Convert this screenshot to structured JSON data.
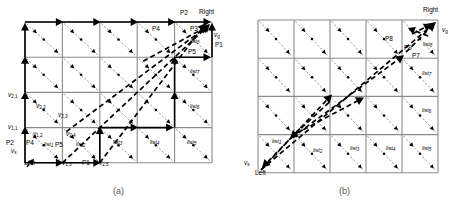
{
  "figure": {
    "type": "technical-diagram",
    "panels": [
      {
        "id": "a",
        "caption": "(a)",
        "grid": {
          "cols": 5,
          "rows": 4,
          "x": 25,
          "y": 22,
          "cell_w": 37.4,
          "cell_h": 35.2
        },
        "terminals": [
          {
            "name": "source-label",
            "text": "v",
            "sub": "s",
            "x": 11,
            "y": 148
          },
          {
            "name": "left-label",
            "text": "Left",
            "sub": "",
            "x": 24,
            "y": 160
          },
          {
            "name": "goal-label",
            "text": "v",
            "sub": "g",
            "x": 214,
            "y": 32
          },
          {
            "name": "right-label",
            "text": "Right",
            "sub": "",
            "x": 199,
            "y": 9
          }
        ],
        "vertex_labels": [
          {
            "name": "vertex-2-1",
            "text": "v",
            "sub": "2,1",
            "x": 8,
            "y": 92
          },
          {
            "name": "vertex-2-2",
            "text": "v",
            "sub": "2,2",
            "x": 36,
            "y": 103
          },
          {
            "name": "vertex-2-3",
            "text": "v",
            "sub": "2,3",
            "x": 58,
            "y": 112
          },
          {
            "name": "vertex-1-1",
            "text": "v",
            "sub": "1,1",
            "x": 8,
            "y": 124
          },
          {
            "name": "vertex-1-2",
            "text": "v",
            "sub": "1,2",
            "x": 33,
            "y": 131
          },
          {
            "name": "vertex-2-4",
            "text": "v",
            "sub": "2,4",
            "x": 66,
            "y": 131
          },
          {
            "name": "vertex-1-3",
            "text": "v",
            "sub": "1,3",
            "x": 62,
            "y": 160
          },
          {
            "name": "vertex-2-5",
            "text": "v",
            "sub": "2,5",
            "x": 99,
            "y": 160
          }
        ],
        "path_labels": [
          {
            "name": "path-p2-bottom",
            "text": "P2",
            "x": 6,
            "y": 140
          },
          {
            "name": "path-p4-bottom",
            "text": "P4",
            "x": 26,
            "y": 140
          },
          {
            "name": "path-p5-bottom",
            "text": "P5",
            "x": 55,
            "y": 142
          },
          {
            "name": "path-p1-bottom",
            "text": "P1",
            "x": 82,
            "y": 160
          },
          {
            "name": "path-p2-top",
            "text": "P2",
            "x": 180,
            "y": 10
          },
          {
            "name": "path-p4-top",
            "text": "P4",
            "x": 152,
            "y": 26
          },
          {
            "name": "path-p3-top",
            "text": "P3",
            "x": 190,
            "y": 26
          },
          {
            "name": "path-p1-right",
            "text": "P1",
            "x": 215,
            "y": 42
          },
          {
            "name": "path-p5-right",
            "text": "P5",
            "x": 188,
            "y": 49
          }
        ],
        "list_labels": [
          {
            "name": "list-1",
            "text": "list",
            "sub": "1",
            "x": 44,
            "y": 142
          },
          {
            "name": "list-2",
            "text": "list",
            "sub": "2",
            "x": 76,
            "y": 142
          },
          {
            "name": "list-3",
            "text": "list",
            "sub": "3",
            "x": 113,
            "y": 140
          },
          {
            "name": "list-4",
            "text": "list",
            "sub": "4",
            "x": 150,
            "y": 140
          },
          {
            "name": "list-5",
            "text": "list",
            "sub": "5",
            "x": 187,
            "y": 140
          },
          {
            "name": "list-6",
            "text": "list",
            "sub": "6",
            "x": 190,
            "y": 104
          },
          {
            "name": "list-7",
            "text": "list",
            "sub": "7",
            "x": 190,
            "y": 69
          },
          {
            "name": "list-8",
            "text": "list",
            "sub": "8",
            "x": 190,
            "y": 39
          }
        ]
      },
      {
        "id": "b",
        "caption": "(b)",
        "grid": {
          "cols": 5,
          "rows": 4,
          "x": 258,
          "y": 20,
          "cell_w": 36.0,
          "cell_h": 38.2
        },
        "terminals": [
          {
            "name": "source-label",
            "text": "v",
            "sub": "s",
            "x": 244,
            "y": 160
          },
          {
            "name": "left-label",
            "text": "Left",
            "sub": "",
            "x": 255,
            "y": 170
          },
          {
            "name": "goal-label",
            "text": "v",
            "sub": "g",
            "x": 442,
            "y": 27
          },
          {
            "name": "right-label",
            "text": "Right",
            "sub": "",
            "x": 423,
            "y": 7
          }
        ],
        "path_labels": [
          {
            "name": "path-p8-top",
            "text": "P8",
            "x": 385,
            "y": 36
          },
          {
            "name": "path-p9-top",
            "text": "P9",
            "x": 404,
            "y": 45
          },
          {
            "name": "path-p7-top",
            "text": "P7",
            "x": 412,
            "y": 53
          }
        ],
        "list_labels": [
          {
            "name": "list-1",
            "text": "list",
            "sub": "1",
            "x": 272,
            "y": 139
          },
          {
            "name": "list-2",
            "text": "list",
            "sub": "2",
            "x": 313,
            "y": 148
          },
          {
            "name": "list-3",
            "text": "list",
            "sub": "3",
            "x": 350,
            "y": 146
          },
          {
            "name": "list-4",
            "text": "list",
            "sub": "4",
            "x": 386,
            "y": 146
          },
          {
            "name": "list-5",
            "text": "list",
            "sub": "5",
            "x": 422,
            "y": 146
          },
          {
            "name": "list-6",
            "text": "list",
            "sub": "6",
            "x": 422,
            "y": 108
          },
          {
            "name": "list-7",
            "text": "list",
            "sub": "7",
            "x": 422,
            "y": 71
          },
          {
            "name": "list-8",
            "text": "list",
            "sub": "8",
            "x": 423,
            "y": 42
          }
        ]
      }
    ],
    "colors": {
      "grid_line": "#8a8a8a",
      "dashed_thin": "#6f6f6f",
      "solid_path": "#000000",
      "thick_dashed": "#000000",
      "caption": "#555555"
    }
  }
}
